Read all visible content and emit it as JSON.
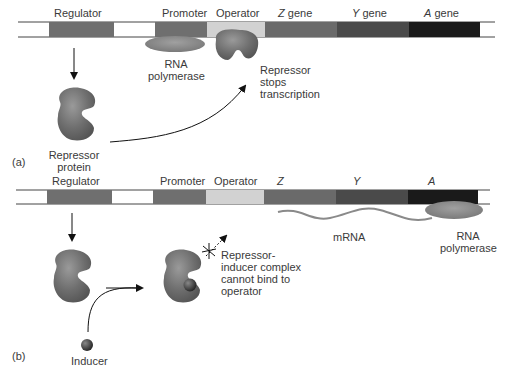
{
  "panel_a": {
    "tag": "(a)",
    "gene_labels": {
      "regulator": "Regulator",
      "promoter": "Promoter",
      "operator": "Operator",
      "z_letter": "Z",
      "y_letter": "Y",
      "a_letter": "A",
      "gene_word": "gene"
    },
    "rna_polymerase_line1": "RNA",
    "rna_polymerase_line2": "polymerase",
    "repressor_stops_line1": "Repressor",
    "repressor_stops_line2": "stops",
    "repressor_stops_line3": "transcription",
    "repressor_protein_line1": "Repressor",
    "repressor_protein_line2": "protein"
  },
  "panel_b": {
    "tag": "(b)",
    "gene_labels": {
      "regulator": "Regulator",
      "promoter": "Promoter",
      "operator": "Operator",
      "z": "Z",
      "y": "Y",
      "a": "A"
    },
    "mrna": "mRNA",
    "rna_polymerase_line1": "RNA",
    "rna_polymerase_line2": "polymerase",
    "complex_line1": "Repressor-",
    "complex_line2": "inducer complex",
    "complex_line3": "cannot bind to",
    "complex_line4": "operator",
    "inducer": "Inducer"
  },
  "colors": {
    "regulator": "#6f6f6f",
    "promoter": "#6f6f6f",
    "operator": "#cfcfcf",
    "z_gene": "#6a6a6a",
    "y_gene": "#4a4a4a",
    "a_gene": "#1a1a1a",
    "protein": "#777777",
    "polymerase": "#8a8a8a"
  }
}
